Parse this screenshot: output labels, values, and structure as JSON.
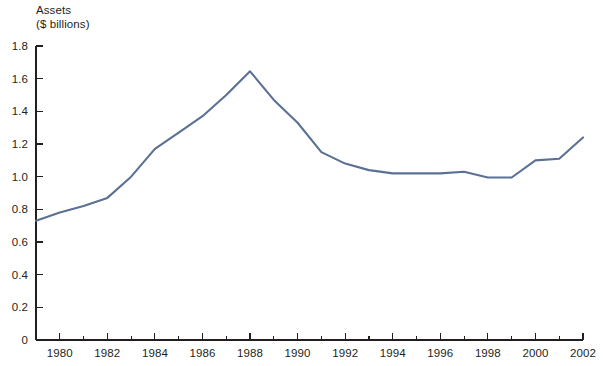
{
  "chart_data": {
    "type": "line",
    "title": "Assets",
    "subtitle": "($ billions)",
    "xlabel": "",
    "ylabel": "Assets ($ billions)",
    "ylim": [
      0,
      1.8
    ],
    "xlim": [
      1979,
      2002
    ],
    "grid": false,
    "legend": null,
    "line_color": "#5a7095",
    "axis_color": "#231f20",
    "background": "#ffffff",
    "y_ticks": [
      "0",
      "0.2",
      "0.4",
      "0.6",
      "0.8",
      "1.0",
      "1.2",
      "1.4",
      "1.6",
      "1.8"
    ],
    "y_tick_values": [
      0,
      0.2,
      0.4,
      0.6,
      0.8,
      1.0,
      1.2,
      1.4,
      1.6,
      1.8
    ],
    "x_ticks": [
      "1980",
      "1982",
      "1984",
      "1986",
      "1988",
      "1990",
      "1992",
      "1994",
      "1996",
      "1998",
      "2000",
      "2002"
    ],
    "x_tick_values": [
      1980,
      1982,
      1984,
      1986,
      1988,
      1990,
      1992,
      1994,
      1996,
      1998,
      2000,
      2002
    ],
    "x_minor_tick_values": [
      1979,
      1981,
      1983,
      1985,
      1987,
      1989,
      1991,
      1993,
      1995,
      1997,
      1999,
      2001
    ],
    "x": [
      1979,
      1980,
      1981,
      1982,
      1983,
      1984,
      1985,
      1986,
      1987,
      1988,
      1989,
      1990,
      1991,
      1992,
      1993,
      1994,
      1995,
      1996,
      1997,
      1998,
      1999,
      2000,
      2001,
      2002
    ],
    "values": [
      0.73,
      0.78,
      0.82,
      0.87,
      1.0,
      1.17,
      1.27,
      1.37,
      1.5,
      1.645,
      1.47,
      1.33,
      1.15,
      1.08,
      1.04,
      1.02,
      1.02,
      1.02,
      1.03,
      0.995,
      0.995,
      1.1,
      1.11,
      1.24
    ],
    "series": [
      {
        "name": "Assets",
        "values": [
          0.73,
          0.78,
          0.82,
          0.87,
          1.0,
          1.17,
          1.27,
          1.37,
          1.5,
          1.645,
          1.47,
          1.33,
          1.15,
          1.08,
          1.04,
          1.02,
          1.02,
          1.02,
          1.03,
          0.995,
          0.995,
          1.1,
          1.11,
          1.24
        ]
      }
    ]
  },
  "geometry": {
    "plot_left": 36,
    "plot_right": 583,
    "plot_top": 46,
    "plot_bottom": 340,
    "major_tick_len": 7,
    "minor_tick_len": 4,
    "y_tick_len": 7
  }
}
